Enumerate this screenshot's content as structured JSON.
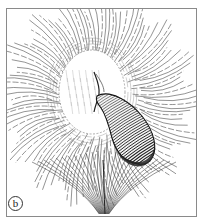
{
  "figure": {
    "label": "b",
    "colors": {
      "ink": "#2a2a2a",
      "frame": "#888888",
      "background": "#ffffff"
    }
  }
}
